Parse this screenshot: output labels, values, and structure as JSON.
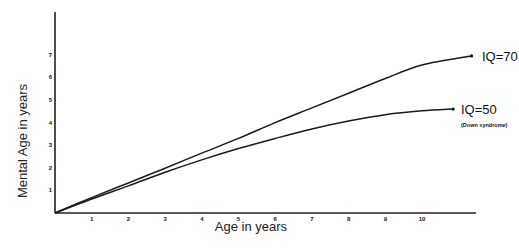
{
  "chart_data": {
    "type": "line",
    "title": "",
    "xlabel": "Age in years",
    "ylabel": "Mental Age in years",
    "xlim": [
      0,
      11.8
    ],
    "ylim": [
      0,
      8.8
    ],
    "xticks": [
      1,
      2,
      3,
      4,
      5,
      6,
      7,
      8,
      9,
      10
    ],
    "yticks": [
      1,
      2,
      3,
      4,
      5,
      6,
      7
    ],
    "grid": false,
    "legend": "inline labels at line ends",
    "series": [
      {
        "name": "IQ=70",
        "note": "",
        "x": [
          0,
          1,
          2,
          3,
          4,
          5,
          6,
          7,
          8,
          9,
          10,
          11.35
        ],
        "y": [
          0,
          0.68,
          1.33,
          1.98,
          2.65,
          3.3,
          4.0,
          4.65,
          5.3,
          5.95,
          6.55,
          6.95
        ]
      },
      {
        "name": "IQ=50",
        "note": "(Down syndrome)",
        "x": [
          0,
          1,
          2,
          3,
          4,
          5,
          6,
          7,
          8,
          9,
          10,
          10.85
        ],
        "y": [
          0,
          0.62,
          1.2,
          1.8,
          2.35,
          2.85,
          3.3,
          3.72,
          4.07,
          4.35,
          4.52,
          4.6
        ]
      }
    ]
  },
  "labels": {
    "x_axis_title": "Age in years",
    "y_axis_title": "Mental Age in years",
    "series_1": "IQ=70",
    "series_2": "IQ=50",
    "series_2_note": "(Down syndrome)"
  }
}
